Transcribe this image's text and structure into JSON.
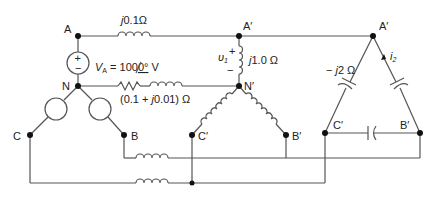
{
  "nodes": {
    "A": "A",
    "N": "N",
    "B": "B",
    "C": "C",
    "A_wye": "A′",
    "N_wye": "N′",
    "B_wye": "B′",
    "C_wye": "C′",
    "A_delta": "A′",
    "B_delta": "B′",
    "C_delta": "C′"
  },
  "labels": {
    "line_impedance_prefix": "j",
    "line_impedance": "0.1Ω",
    "source_label_v": "V",
    "source_label_sub": "A",
    "source_value": " = 100",
    "source_angle": "0°",
    "source_unit": " V",
    "neutral_impedance_pre": "(0.1 + ",
    "neutral_impedance_j": "j",
    "neutral_impedance_post": "0.01) Ω",
    "wye_load_j": "j",
    "wye_load": "1.0 Ω",
    "voltage_v": "υ",
    "voltage_sub": "1",
    "plus": "+",
    "minus": "−",
    "delta_load_pre": "− ",
    "delta_load_j": "j",
    "delta_load": "2 Ω",
    "current_i": "i",
    "current_sub": "2",
    "src_plus": "+",
    "src_minus": "−"
  }
}
